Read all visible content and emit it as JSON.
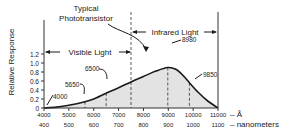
{
  "chart_data": {
    "type": "area",
    "title": "Typical Phototransistor",
    "ylabel": "Relative Response",
    "xlabel_primary": "Å",
    "xlabel_secondary": "nanometers",
    "xlim": [
      4000,
      11000
    ],
    "ylim": [
      0,
      1.3
    ],
    "x_ticks_angstrom": [
      "4000",
      "5000",
      "6000",
      "7000",
      "8000",
      "9000",
      "10000",
      "11000"
    ],
    "x_ticks_nm": [
      "400",
      "500",
      "600",
      "700",
      "800",
      "900",
      "1000",
      "1100"
    ],
    "y_ticks": [
      "0",
      "0.2",
      "0.4",
      "0.6",
      "0.8",
      "1.0",
      "1.2"
    ],
    "grid": false,
    "series": [
      {
        "name": "Relative Response",
        "x": [
          4000,
          4500,
          5000,
          5650,
          6000,
          6500,
          7000,
          7500,
          8000,
          8500,
          8980,
          9300,
          9600,
          9850,
          10200,
          10600,
          11000
        ],
        "y": [
          0.0,
          0.02,
          0.06,
          0.14,
          0.2,
          0.33,
          0.45,
          0.58,
          0.7,
          0.82,
          0.9,
          0.86,
          0.72,
          0.56,
          0.35,
          0.15,
          0.0
        ]
      }
    ],
    "annotations": [
      {
        "label": "4000",
        "x": 4000
      },
      {
        "label": "5650",
        "x": 5650
      },
      {
        "label": "6500",
        "x": 6500
      },
      {
        "label": "8980",
        "x": 8980
      },
      {
        "label": "9850",
        "x": 9850
      }
    ],
    "regions": [
      {
        "label": "Visible Light",
        "from": 4000,
        "to": 7500
      },
      {
        "label": "Infrared Light",
        "to_right_of": 7500
      }
    ],
    "dashed_lines_x": [
      5650,
      6500,
      7500,
      8980,
      9850
    ]
  },
  "labels": {
    "title_line1": "Typical",
    "title_line2": "Phototransistor",
    "ylabel": "Relative Response",
    "visible": "Visible Light",
    "infrared": "Infrared Light",
    "unit_angstrom": "– Å",
    "unit_nm": "– nanometers",
    "a4000": "4000",
    "a5650": "5650",
    "a6500": "6500",
    "a8980": "8980",
    "a9850": "9850"
  },
  "colors": {
    "fill": "#e3e3e3",
    "line": "#1a1a1a"
  }
}
